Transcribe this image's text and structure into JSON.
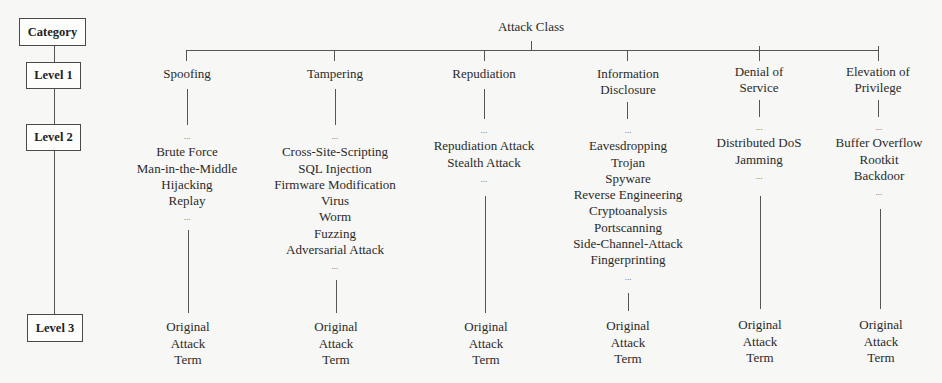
{
  "legend": {
    "category": "Category",
    "level1": "Level 1",
    "level2": "Level 2",
    "level3": "Level 3"
  },
  "root": {
    "label": "Attack Class"
  },
  "ellipsis": "...",
  "classes": [
    {
      "label_lines": [
        "Spoofing"
      ],
      "examples": [
        "Brute Force",
        "Man-in-the-Middle",
        "Hijacking",
        "Replay"
      ],
      "term_lines": [
        "Original",
        "Attack",
        "Term"
      ]
    },
    {
      "label_lines": [
        "Tampering"
      ],
      "examples": [
        "Cross-Site-Scripting",
        "SQL Injection",
        "Firmware Modification",
        "Virus",
        "Worm",
        "Fuzzing",
        "Adversarial Attack"
      ],
      "term_lines": [
        "Original",
        "Attack",
        "Term"
      ]
    },
    {
      "label_lines": [
        "Repudiation"
      ],
      "examples": [
        "Repudiation Attack",
        "Stealth Attack"
      ],
      "term_lines": [
        "Original",
        "Attack",
        "Term"
      ]
    },
    {
      "label_lines": [
        "Information",
        "Disclosure"
      ],
      "examples": [
        "Eavesdropping",
        "Trojan",
        "Spyware",
        "Reverse Engineering",
        "Cryptoanalysis",
        "Portscanning",
        "Side-Channel-Attack",
        "Fingerprinting"
      ],
      "term_lines": [
        "Original",
        "Attack",
        "Term"
      ]
    },
    {
      "label_lines": [
        "Denial of",
        "Service"
      ],
      "examples": [
        "Distributed DoS",
        "Jamming"
      ],
      "term_lines": [
        "Original",
        "Attack",
        "Term"
      ]
    },
    {
      "label_lines": [
        "Elevation of",
        "Privilege"
      ],
      "examples": [
        "Buffer Overflow",
        "Rootkit",
        "Backdoor"
      ],
      "term_lines": [
        "Original",
        "Attack",
        "Term"
      ]
    }
  ]
}
